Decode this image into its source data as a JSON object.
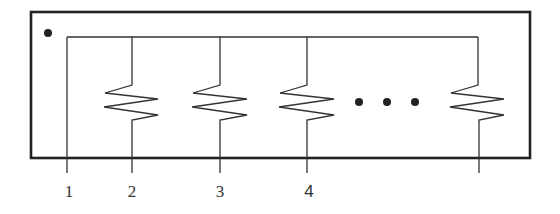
{
  "diagram": {
    "type": "resistor-network-package",
    "colors": {
      "stroke": "#222222",
      "background": "#ffffff",
      "label": "#333333"
    },
    "package": {
      "x": 31,
      "y": 12,
      "width": 499,
      "height": 146,
      "pin1_marker": {
        "cx": 48,
        "cy": 33,
        "r": 4
      }
    },
    "bus": {
      "y": 37,
      "x_start": 67,
      "x_end": 478
    },
    "pins": [
      {
        "label": "1",
        "x": 67,
        "has_resistor": false
      },
      {
        "label": "2",
        "x": 132,
        "has_resistor": true
      },
      {
        "label": "3",
        "x": 220,
        "has_resistor": true
      },
      {
        "label": "4",
        "x": 307,
        "has_resistor": true
      },
      {
        "label": "",
        "x": 478,
        "has_resistor": true
      }
    ],
    "ellipsis_dots": [
      {
        "cx": 359,
        "cy": 102
      },
      {
        "cx": 387,
        "cy": 102
      },
      {
        "cx": 415,
        "cy": 102
      }
    ],
    "lead_bottom_y": 173,
    "label_y": 196
  }
}
